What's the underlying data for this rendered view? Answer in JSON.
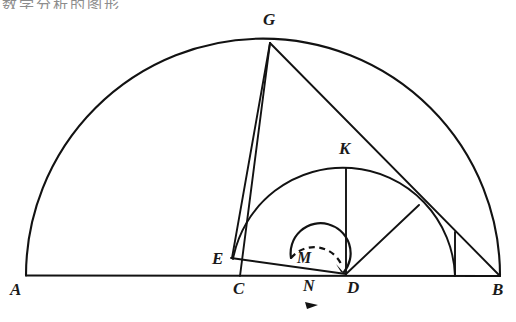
{
  "figure": {
    "kind": "geometry-diagram",
    "top_cut_text": "数学分析的图形",
    "background_color": "#ffffff",
    "ink_color": "#121212"
  },
  "points": [
    {
      "id": "A",
      "label": "A",
      "x": 26,
      "y": 275,
      "label_x": 10,
      "label_y": 281,
      "role": "left-endpoint-of-diameter"
    },
    {
      "id": "B",
      "label": "B",
      "x": 500,
      "y": 276,
      "label_x": 492,
      "label_y": 281,
      "role": "right-endpoint-of-diameter"
    },
    {
      "id": "G",
      "label": "G",
      "x": 270,
      "y": 42,
      "label_x": 263,
      "label_y": 11,
      "role": "apex-on-large-arc"
    },
    {
      "id": "K",
      "label": "K",
      "x": 346,
      "y": 168,
      "label_x": 339,
      "label_y": 140,
      "role": "top-of-inner-semicircle"
    },
    {
      "id": "E",
      "label": "E",
      "x": 233,
      "y": 259,
      "label_x": 212,
      "label_y": 251,
      "role": "left-end-of-inner-diameter"
    },
    {
      "id": "C",
      "label": "C",
      "x": 240,
      "y": 276,
      "label_x": 233,
      "label_y": 281,
      "role": "foot-of-altitude-from-G"
    },
    {
      "id": "D",
      "label": "D",
      "x": 345,
      "y": 273,
      "label_x": 347,
      "label_y": 280,
      "role": "right-end-of-inner-diameter"
    },
    {
      "id": "M",
      "label": "M",
      "x": 305,
      "y": 262,
      "label_x": 297,
      "label_y": 252,
      "role": "small-circle-upper-label"
    },
    {
      "id": "N",
      "label": "N",
      "x": 311,
      "y": 288,
      "label_x": 303,
      "label_y": 279,
      "role": "small-circle-lower-label"
    }
  ],
  "shapes": {
    "large_semicircle": {
      "name": "semicircle-AB",
      "cx": 263,
      "cy": 275.5,
      "r": 237,
      "start_label": "A",
      "end_label": "B"
    },
    "inner_semicircle": {
      "name": "semicircle-ED",
      "cx": 344,
      "cy": 276,
      "r": 111,
      "tilt_note": "drawn from E up through K down to right end"
    },
    "small_circle": {
      "name": "circle-MN",
      "cx": 310,
      "cy": 275,
      "r": 30,
      "dashed_top": true,
      "direction_arrow": "clockwise"
    }
  },
  "segments": [
    {
      "name": "segment-AB-diameter",
      "from": "A",
      "to": "B"
    },
    {
      "name": "segment-GC-altitude",
      "from": "G",
      "to": "C"
    },
    {
      "name": "segment-GE",
      "from": "G",
      "to": "E"
    },
    {
      "name": "segment-GB-chord",
      "from": "G",
      "to": "B"
    },
    {
      "name": "segment-ED",
      "from": "E",
      "to": "D"
    },
    {
      "name": "segment-KD-vertical",
      "from": "K",
      "to": "D"
    },
    {
      "name": "segment-D-to-arc-intersection",
      "from": "D",
      "to": "P"
    },
    {
      "name": "segment-inner-arc-right-foot",
      "from": "F",
      "to": "B-line"
    }
  ]
}
